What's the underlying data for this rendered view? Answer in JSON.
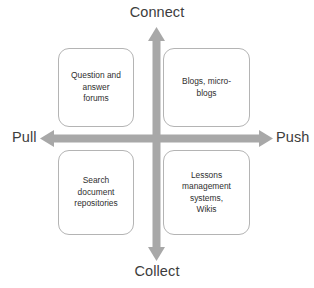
{
  "diagram": {
    "type": "2x2-quadrant-matrix",
    "axes": {
      "vertical": {
        "top_label": "Connect",
        "bottom_label": "Collect",
        "arrow_color": "#a8a8a8",
        "double_headed": true
      },
      "horizontal": {
        "left_label": "Pull",
        "right_label": "Push",
        "arrow_color": "#a8a8a8",
        "double_headed": true
      }
    },
    "quadrants": [
      {
        "position": "top-left",
        "axis_combination": "Connect + Pull",
        "text": "Question and\nanswer\nforums"
      },
      {
        "position": "top-right",
        "axis_combination": "Connect + Push",
        "text": "Blogs, micro-\nblogs"
      },
      {
        "position": "bottom-left",
        "axis_combination": "Collect + Pull",
        "text": "Search\ndocument\nrepositories"
      },
      {
        "position": "bottom-right",
        "axis_combination": "Collect + Push",
        "text": "Lessons\nmanagement\nsystems,\nWikis"
      }
    ],
    "colors": {
      "box_border": "#b4b4b4",
      "box_fill": "#ffffff",
      "arrow": "#a8a8a8",
      "axis_label_text": "#3d3d3d",
      "box_text": "#2f2f2f",
      "background": "#ffffff"
    }
  }
}
